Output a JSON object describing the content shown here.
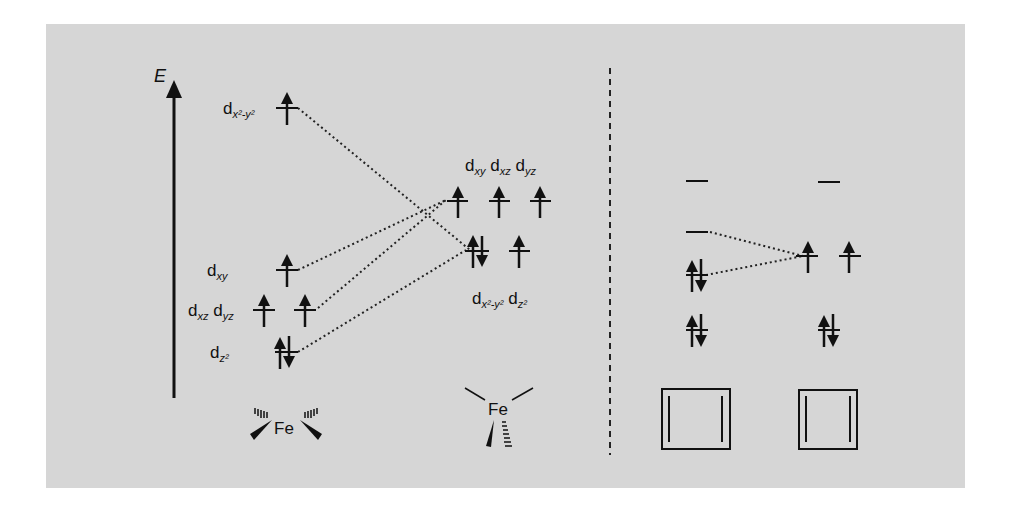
{
  "figure": {
    "axis_label": "E",
    "background_color": "#d6d6d6",
    "ink_color": "#111111",
    "left_diagram": {
      "description": "d-orbital splitting correlation: tetrahedral-like Fe to trigonal Fe",
      "initial_levels": [
        {
          "label_main": "d",
          "label_sub": "x²-y²",
          "electrons": "up",
          "count": 1
        },
        {
          "label_main": "d",
          "label_sub": "xy",
          "electrons": "up",
          "count": 1
        },
        {
          "label_main": "d",
          "label_sub": "xz",
          "electrons": "up",
          "count": 1
        },
        {
          "label_main": "d",
          "label_sub": "yz",
          "electrons": "up",
          "count": 1
        },
        {
          "label_main": "d",
          "label_sub": "z²",
          "electrons": "up-down",
          "count": 2
        }
      ],
      "final_levels": {
        "upper_label": {
          "parts": [
            {
              "main": "d",
              "sub": "xy"
            },
            {
              "main": "d",
              "sub": "xz"
            },
            {
              "main": "d",
              "sub": "yz"
            }
          ]
        },
        "upper_electrons": [
          "up",
          "up",
          "up"
        ],
        "lower_label": {
          "parts": [
            {
              "main": "d",
              "sub": "x²-y²"
            },
            {
              "main": "d",
              "sub": "z²"
            }
          ]
        },
        "lower_electrons": [
          "up-down",
          "up"
        ]
      },
      "initial_complex_label": "Fe",
      "final_complex_label": "Fe"
    },
    "right_diagram": {
      "left_column": [
        "empty",
        "empty",
        "up-down",
        "up-down"
      ],
      "right_column": [
        "empty",
        "up up",
        "up-down"
      ],
      "bottom_icons": [
        "square-with-bars-icon",
        "square-with-bars-icon"
      ]
    }
  }
}
